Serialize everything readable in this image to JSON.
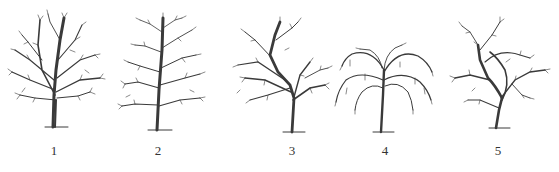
{
  "figure": {
    "trees": [
      {
        "number": "1",
        "form": "round-crown",
        "cx": 55
      },
      {
        "number": "2",
        "form": "central-leader",
        "cx": 158
      },
      {
        "number": "3",
        "form": "modified-leader",
        "cx": 294
      },
      {
        "number": "4",
        "form": "weeping",
        "cx": 383
      },
      {
        "number": "5",
        "form": "open-irregular",
        "cx": 499
      }
    ],
    "labels": [
      "1",
      "2",
      "3",
      "4",
      "5"
    ],
    "colors": {
      "ink": "#333333",
      "background": "#ffffff"
    }
  }
}
